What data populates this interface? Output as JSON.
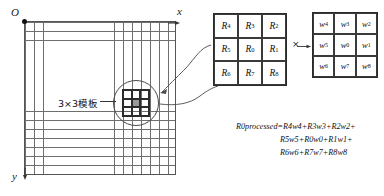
{
  "diagram": {
    "axes": {
      "origin_label": "O",
      "x_label": "x",
      "y_label": "y"
    },
    "grid": {
      "columns": 17,
      "rows": 17,
      "template_label": "3×3模板",
      "center_cell_color": "#9b9b9b",
      "line_color": "#6e6e6e"
    },
    "matrix_r": {
      "name": "R",
      "rows": [
        [
          {
            "base": "R",
            "sub": "4"
          },
          {
            "base": "R",
            "sub": "3"
          },
          {
            "base": "R",
            "sub": "2"
          }
        ],
        [
          {
            "base": "R",
            "sub": "5"
          },
          {
            "base": "R",
            "sub": "0"
          },
          {
            "base": "R",
            "sub": "1"
          }
        ],
        [
          {
            "base": "R",
            "sub": "6"
          },
          {
            "base": "R",
            "sub": "7"
          },
          {
            "base": "R",
            "sub": "8"
          }
        ]
      ]
    },
    "operator": "×",
    "matrix_w": {
      "name": "w",
      "rows": [
        [
          {
            "base": "w",
            "sub": "4"
          },
          {
            "base": "w",
            "sub": "3"
          },
          {
            "base": "w",
            "sub": "2"
          }
        ],
        [
          {
            "base": "w",
            "sub": "5"
          },
          {
            "base": "w",
            "sub": "0"
          },
          {
            "base": "w",
            "sub": "1"
          }
        ],
        [
          {
            "base": "w",
            "sub": "6"
          },
          {
            "base": "w",
            "sub": "7"
          },
          {
            "base": "w",
            "sub": "8"
          }
        ]
      ]
    },
    "formula": {
      "line1": "R0processed=R4w4+R3w3+R2w2+",
      "line2": "R5w5+R0w0+R1w1+",
      "line3": "R6w6+R7w7+R8w8"
    }
  }
}
